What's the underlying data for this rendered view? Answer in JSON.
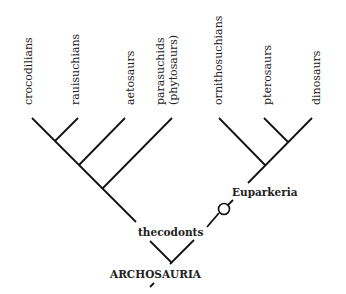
{
  "diagram": {
    "type": "cladogram",
    "taxa": [
      {
        "label": "crocodilians"
      },
      {
        "label": "rauisuchians"
      },
      {
        "label": "aetosaurs"
      },
      {
        "label": "parasuchids",
        "sublabel": "(phytosaurs)"
      },
      {
        "label": "ornithosuchians"
      },
      {
        "label": "pterosaurs"
      },
      {
        "label": "dinosaurs"
      }
    ],
    "nodes": {
      "thecodonts": "thecodonts",
      "euparkeria": "Euparkeria",
      "root": "ARCHOSAURIA"
    },
    "markers": {
      "open_circle": "character-marker"
    }
  }
}
